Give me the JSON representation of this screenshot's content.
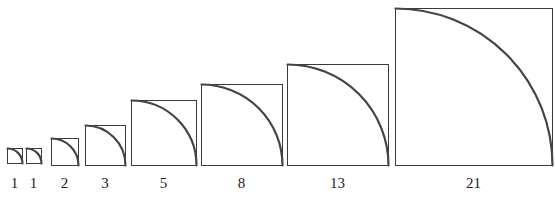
{
  "colors": {
    "stroke": "#3a3a3a",
    "arc": "#444444",
    "label": "#222222",
    "background": "#ffffff"
  },
  "squares": [
    {
      "label": "1",
      "x": 7,
      "y": 148,
      "size": 15
    },
    {
      "label": "1",
      "x": 26,
      "y": 148,
      "size": 15
    },
    {
      "label": "2",
      "x": 51,
      "y": 138,
      "size": 27
    },
    {
      "label": "3",
      "x": 85,
      "y": 125,
      "size": 40
    },
    {
      "label": "5",
      "x": 131,
      "y": 100,
      "size": 65
    },
    {
      "label": "8",
      "x": 201,
      "y": 84,
      "size": 81
    },
    {
      "label": "13",
      "x": 287,
      "y": 64,
      "size": 101
    },
    {
      "label": "21",
      "x": 395,
      "y": 8,
      "size": 157
    }
  ],
  "label_y": 188
}
